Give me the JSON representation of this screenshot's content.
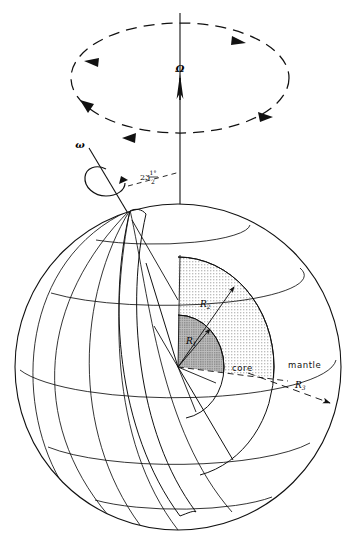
{
  "figure": {
    "background_color": "#ffffff",
    "line_color": "#1a1a1a",
    "stipple_color": "#9a9a9a",
    "inner_core_fill": "#a8a8a8",
    "outer_core_fill": "#d8d8d8"
  },
  "labels": {
    "precession_axis": "Ω",
    "spin_axis": "ω",
    "tilt_number": "23",
    "tilt_numerator": "1°",
    "tilt_denominator": "2",
    "tilt_full": "23 1°/2",
    "radius_inner": "R",
    "radius_inner_sub": "1",
    "radius_outer_core": "R",
    "radius_outer_core_sub": "2",
    "radius_earth": "R",
    "radius_earth_sub": "3",
    "region_core": "core",
    "region_mantle": "mantle"
  },
  "icons": {
    "precession_arrow": "up-arrow-icon",
    "spin_arrow": "rotation-loop-icon",
    "precession_circle": "dashed-ellipse-icon",
    "angle_marker": "dashed-angle-icon"
  },
  "geometry": {
    "sphere_center_x": 178,
    "sphere_center_y": 367,
    "sphere_radius": 163,
    "core_boundary_radius": 90,
    "inner_core_radius": 45,
    "precession_ellipse_cx": 180,
    "precession_ellipse_cy": 78,
    "precession_ellipse_rx": 109,
    "precession_ellipse_ry": 55,
    "axis_tilt_degrees": 23.5
  }
}
